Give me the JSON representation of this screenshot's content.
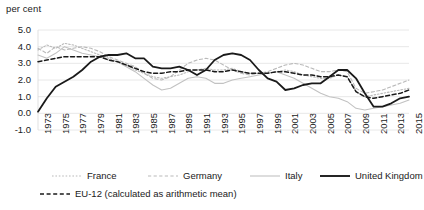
{
  "axis_unit_label": "per cent",
  "legend": {
    "row1": [
      {
        "name": "France",
        "style": "dotted",
        "color": "#b9b9b9"
      },
      {
        "name": "Germany",
        "style": "dashed",
        "color": "#b9b9b9"
      },
      {
        "name": "Italy",
        "style": "solid",
        "color": "#c2c2c2"
      },
      {
        "name": "United Kingdom",
        "style": "solid",
        "color": "#1a1a1a"
      }
    ],
    "row2": [
      {
        "name": "EU-12 (calculated as arithmetic mean)",
        "style": "dashed",
        "color": "#1a1a1a"
      }
    ]
  },
  "chart_data": {
    "type": "line",
    "title": "",
    "xlabel": "",
    "ylabel": "per cent",
    "ylim": [
      -1.0,
      5.0
    ],
    "xlim": [
      1973,
      2015
    ],
    "grid": true,
    "legend_position": "bottom",
    "ytick_labels": [
      "5.0",
      "4.0",
      "3.0",
      "2.0",
      "1.0",
      "0.0",
      "-1.0"
    ],
    "ytick_values": [
      5.0,
      4.0,
      3.0,
      2.0,
      1.0,
      0.0,
      -1.0
    ],
    "xtick_labels": [
      "1973",
      "1975",
      "1977",
      "1979",
      "1981",
      "1983",
      "1985",
      "1987",
      "1989",
      "1991",
      "1993",
      "1995",
      "1997",
      "1999",
      "2001",
      "2003",
      "2005",
      "2007",
      "2009",
      "2011",
      "2013",
      "2015"
    ],
    "xtick_values": [
      1973,
      1975,
      1977,
      1979,
      1981,
      1983,
      1985,
      1987,
      1989,
      1991,
      1993,
      1995,
      1997,
      1999,
      2001,
      2003,
      2005,
      2007,
      2009,
      2011,
      2013,
      2015
    ],
    "x": [
      1973,
      1974,
      1975,
      1976,
      1977,
      1978,
      1979,
      1980,
      1981,
      1982,
      1983,
      1984,
      1985,
      1986,
      1987,
      1988,
      1989,
      1990,
      1991,
      1992,
      1993,
      1994,
      1995,
      1996,
      1997,
      1998,
      1999,
      2000,
      2001,
      2002,
      2003,
      2004,
      2005,
      2006,
      2007,
      2008,
      2009,
      2010,
      2011,
      2012,
      2013,
      2014,
      2015
    ],
    "series": [
      {
        "name": "France",
        "style": "dotted",
        "color": "#b9b9b9",
        "width": 1.1,
        "values": [
          3.8,
          4.1,
          3.9,
          4.2,
          4.1,
          3.9,
          3.7,
          3.5,
          3.3,
          3.1,
          2.9,
          2.6,
          2.4,
          2.2,
          2.1,
          2.2,
          2.3,
          2.5,
          2.6,
          2.7,
          2.6,
          2.6,
          2.7,
          2.5,
          2.4,
          2.4,
          2.4,
          2.5,
          2.6,
          2.5,
          2.3,
          2.2,
          2.1,
          2.1,
          2.3,
          2.2,
          1.3,
          1.0,
          1.1,
          1.2,
          1.3,
          1.4,
          1.5
        ]
      },
      {
        "name": "Germany",
        "style": "dashed",
        "color": "#b9b9b9",
        "width": 1.1,
        "values": [
          3.9,
          3.6,
          4.0,
          3.8,
          3.9,
          4.0,
          3.9,
          3.7,
          3.4,
          3.2,
          3.0,
          2.8,
          2.4,
          2.1,
          2.0,
          2.2,
          2.6,
          3.0,
          3.2,
          3.3,
          3.2,
          2.9,
          2.6,
          2.4,
          2.3,
          2.4,
          2.5,
          2.7,
          2.9,
          3.0,
          2.9,
          2.7,
          2.5,
          2.5,
          2.6,
          2.5,
          1.5,
          1.2,
          1.3,
          1.4,
          1.6,
          1.8,
          2.0
        ]
      },
      {
        "name": "Italy",
        "style": "solid",
        "color": "#c2c2c2",
        "width": 1.1,
        "values": [
          3.5,
          3.3,
          3.6,
          4.0,
          3.8,
          3.6,
          3.5,
          3.4,
          3.2,
          3.1,
          2.8,
          2.5,
          2.1,
          1.7,
          1.4,
          1.5,
          1.8,
          2.1,
          2.2,
          2.1,
          1.8,
          1.8,
          2.0,
          2.1,
          2.2,
          2.3,
          2.4,
          2.5,
          2.3,
          2.1,
          1.8,
          1.5,
          1.2,
          1.0,
          0.9,
          0.7,
          0.3,
          0.2,
          0.3,
          0.4,
          0.5,
          0.6,
          0.8
        ]
      },
      {
        "name": "United Kingdom",
        "style": "solid",
        "color": "#1a1a1a",
        "width": 1.8,
        "values": [
          0.1,
          0.9,
          1.6,
          1.9,
          2.2,
          2.6,
          3.1,
          3.4,
          3.5,
          3.5,
          3.6,
          3.3,
          3.3,
          2.8,
          2.7,
          2.7,
          2.8,
          2.6,
          2.3,
          2.6,
          3.2,
          3.5,
          3.6,
          3.5,
          3.2,
          2.6,
          2.1,
          1.9,
          1.4,
          1.5,
          1.7,
          1.8,
          1.8,
          2.2,
          2.6,
          2.6,
          2.1,
          1.2,
          0.4,
          0.4,
          0.6,
          0.9,
          1.0
        ]
      },
      {
        "name": "EU-12 (calculated as arithmetic mean)",
        "style": "dashed",
        "color": "#1a1a1a",
        "width": 1.5,
        "values": [
          3.1,
          3.2,
          3.3,
          3.4,
          3.4,
          3.4,
          3.4,
          3.4,
          3.2,
          3.1,
          2.9,
          2.7,
          2.5,
          2.4,
          2.4,
          2.5,
          2.5,
          2.6,
          2.6,
          2.6,
          2.5,
          2.5,
          2.6,
          2.5,
          2.4,
          2.4,
          2.4,
          2.5,
          2.5,
          2.4,
          2.3,
          2.3,
          2.2,
          2.2,
          2.3,
          2.2,
          1.3,
          1.0,
          0.9,
          1.0,
          1.1,
          1.2,
          1.4
        ]
      }
    ]
  }
}
